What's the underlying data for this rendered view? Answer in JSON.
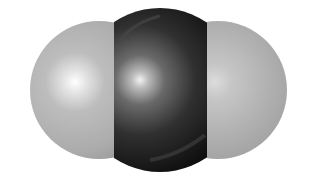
{
  "figure": {
    "atoms": [
      {
        "role": "left-atom",
        "color": "#b4b4b4",
        "highlight": "#ffffff"
      },
      {
        "role": "center-atom",
        "color": "#1c1c1c",
        "highlight": "#e8e8e8"
      },
      {
        "role": "right-atom",
        "color": "#b4b4b4",
        "highlight": "#ffffff"
      }
    ],
    "background": "#ffffff"
  }
}
